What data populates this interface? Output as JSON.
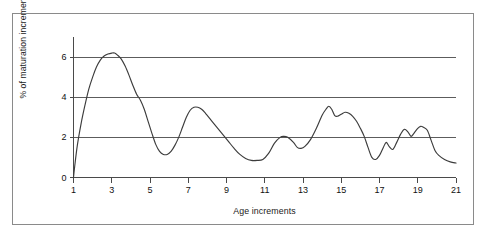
{
  "figure": {
    "background_color": "#ffffff",
    "frame_color": "#8a8a8a",
    "curve_color": "#3c3c3c",
    "gridline_color": "#4a4a4a",
    "axis_color": "#4a4a4a"
  },
  "chart_data": {
    "type": "line",
    "title": "",
    "xlabel": "Age increments",
    "ylabel": "% of maturation increments",
    "xlim": [
      1,
      21
    ],
    "ylim": [
      0,
      7
    ],
    "xticks": [
      1,
      3,
      5,
      7,
      9,
      11,
      13,
      15,
      17,
      19,
      21
    ],
    "xtick_labels": [
      "1",
      "3",
      "5",
      "7",
      "9",
      "11",
      "13",
      "15",
      "17",
      "19",
      "21"
    ],
    "yticks": [
      0,
      2,
      4,
      6
    ],
    "ytick_labels": [
      "0",
      "2",
      "4",
      "6"
    ],
    "gridlines_y": [
      2,
      4,
      6
    ],
    "grid": true,
    "legend": null,
    "series": [
      {
        "name": "maturation increments",
        "x": [
          1.0,
          1.05,
          1.2,
          1.4,
          1.6,
          1.8,
          2.0,
          2.2,
          2.4,
          2.6,
          2.8,
          3.0,
          3.15,
          3.3,
          3.5,
          3.7,
          3.9,
          4.1,
          4.3,
          4.5,
          4.7,
          4.9,
          5.1,
          5.3,
          5.5,
          5.7,
          5.9,
          6.1,
          6.3,
          6.5,
          6.7,
          6.9,
          7.1,
          7.3,
          7.5,
          7.7,
          7.9,
          8.2,
          8.5,
          8.8,
          9.1,
          9.4,
          9.7,
          10.0,
          10.3,
          10.6,
          10.9,
          11.2,
          11.5,
          11.8,
          12.0,
          12.2,
          12.5,
          12.7,
          12.9,
          13.1,
          13.4,
          13.7,
          14.0,
          14.2,
          14.35,
          14.5,
          14.65,
          14.8,
          15.0,
          15.2,
          15.4,
          15.6,
          15.8,
          16.0,
          16.2,
          16.4,
          16.6,
          16.8,
          17.0,
          17.2,
          17.35,
          17.5,
          17.7,
          17.9,
          18.1,
          18.3,
          18.5,
          18.65,
          18.8,
          19.0,
          19.15,
          19.3,
          19.5,
          19.7,
          19.9,
          20.1,
          20.4,
          20.7,
          21.0
        ],
        "y": [
          0.0,
          0.45,
          1.6,
          2.7,
          3.6,
          4.4,
          5.0,
          5.5,
          5.85,
          6.05,
          6.15,
          6.2,
          6.2,
          6.1,
          5.9,
          5.55,
          5.1,
          4.6,
          4.15,
          3.85,
          3.4,
          2.8,
          2.2,
          1.65,
          1.3,
          1.15,
          1.15,
          1.3,
          1.6,
          2.0,
          2.5,
          3.0,
          3.35,
          3.5,
          3.5,
          3.4,
          3.2,
          2.85,
          2.5,
          2.15,
          1.8,
          1.45,
          1.15,
          0.95,
          0.85,
          0.85,
          0.9,
          1.2,
          1.7,
          2.0,
          2.05,
          2.0,
          1.75,
          1.5,
          1.45,
          1.55,
          1.9,
          2.45,
          3.1,
          3.4,
          3.55,
          3.4,
          3.1,
          3.05,
          3.15,
          3.25,
          3.2,
          3.05,
          2.8,
          2.45,
          2.05,
          1.5,
          1.0,
          0.9,
          1.1,
          1.5,
          1.75,
          1.55,
          1.4,
          1.75,
          2.15,
          2.4,
          2.25,
          2.05,
          2.2,
          2.45,
          2.55,
          2.5,
          2.35,
          1.85,
          1.35,
          1.1,
          0.9,
          0.78,
          0.72
        ]
      }
    ]
  }
}
